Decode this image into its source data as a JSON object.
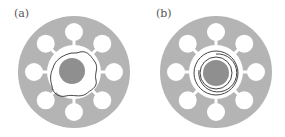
{
  "figure": {
    "panels": [
      {
        "label": "(a)",
        "description": "Disc with eight peripheral holes and irregular boundary around central core"
      },
      {
        "label": "(b)",
        "description": "Disc with eight peripheral holes and concentric spiral rings around central core"
      }
    ],
    "colors": {
      "disc": "#b4b4b4",
      "core": "#8f8f8f",
      "hole": "#ffffff",
      "line": "#444444"
    }
  }
}
